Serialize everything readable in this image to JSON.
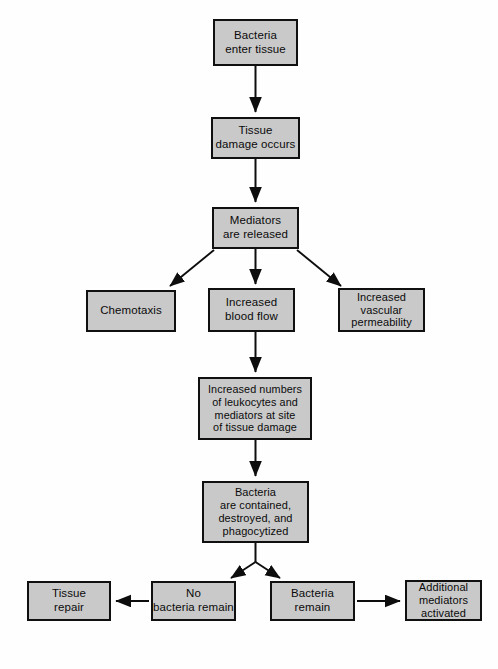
{
  "diagram": {
    "colors": {
      "box_fill": "#c9c9c9",
      "box_border": "#101010",
      "arrow": "#0d0d0d",
      "background": "#fefefe",
      "text": "#0b0b0b"
    },
    "nodes": [
      {
        "id": "bacteria_enter",
        "label": "Bacteria\nenter tissue"
      },
      {
        "id": "tissue_damage",
        "label": "Tissue\ndamage occurs"
      },
      {
        "id": "mediators",
        "label": "Mediators\nare released"
      },
      {
        "id": "chemotaxis",
        "label": "Chemotaxis"
      },
      {
        "id": "blood_flow",
        "label": "Increased\nblood flow"
      },
      {
        "id": "vascular",
        "label": "Increased\nvascular\npermeability"
      },
      {
        "id": "leukocytes",
        "label": "Increased numbers\nof leukocytes and\nmediators at site\nof tissue damage"
      },
      {
        "id": "contained",
        "label": "Bacteria\nare contained,\ndestroyed, and\nphagocytized"
      },
      {
        "id": "tissue_repair",
        "label": "Tissue\nrepair"
      },
      {
        "id": "no_bacteria",
        "label": "No\nbacteria remain"
      },
      {
        "id": "bacteria_remain",
        "label": "Bacteria remain"
      },
      {
        "id": "additional",
        "label": "Additional\nmediators\nactivated"
      }
    ],
    "edges": [
      {
        "from": "bacteria_enter",
        "to": "tissue_damage",
        "direction": "down"
      },
      {
        "from": "tissue_damage",
        "to": "mediators",
        "direction": "down"
      },
      {
        "from": "mediators",
        "to": "chemotaxis",
        "direction": "down-left"
      },
      {
        "from": "mediators",
        "to": "blood_flow",
        "direction": "down"
      },
      {
        "from": "mediators",
        "to": "vascular",
        "direction": "down-right"
      },
      {
        "from": "blood_flow",
        "to": "leukocytes",
        "direction": "down"
      },
      {
        "from": "leukocytes",
        "to": "contained",
        "direction": "down"
      },
      {
        "from": "contained",
        "to": "no_bacteria",
        "direction": "down-left"
      },
      {
        "from": "contained",
        "to": "bacteria_remain",
        "direction": "down-right"
      },
      {
        "from": "no_bacteria",
        "to": "tissue_repair",
        "direction": "left"
      },
      {
        "from": "bacteria_remain",
        "to": "additional",
        "direction": "right"
      }
    ]
  }
}
